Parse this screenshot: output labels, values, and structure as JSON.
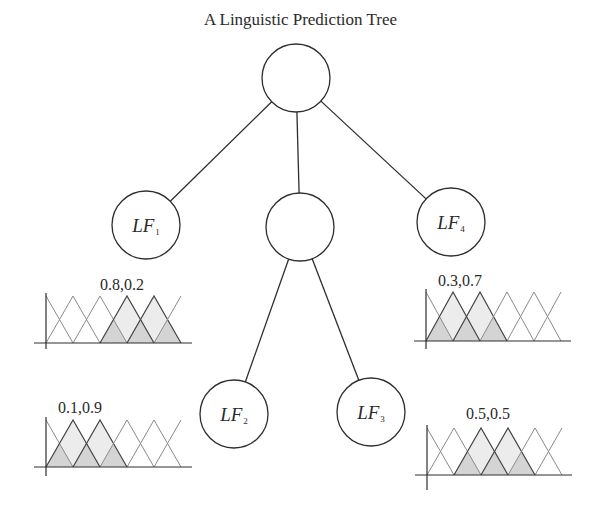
{
  "title": "A Linguistic Prediction Tree",
  "colors": {
    "stroke": "#2e2e2e",
    "mf_stroke": "#555555",
    "fill_light": "#ececec",
    "fill_dark": "#d4d4d4",
    "background": "#ffffff"
  },
  "tree": {
    "nodes": [
      {
        "id": "root",
        "cx": 296,
        "cy": 78,
        "r": 34,
        "label": "",
        "sub": ""
      },
      {
        "id": "lf1",
        "cx": 146,
        "cy": 225,
        "r": 34,
        "label": "LF",
        "sub": "1"
      },
      {
        "id": "mid",
        "cx": 300,
        "cy": 227,
        "r": 34,
        "label": "",
        "sub": ""
      },
      {
        "id": "lf4",
        "cx": 451,
        "cy": 222,
        "r": 34,
        "label": "LF",
        "sub": "4"
      },
      {
        "id": "lf2",
        "cx": 234,
        "cy": 414,
        "r": 34,
        "label": "LF",
        "sub": "2"
      },
      {
        "id": "lf3",
        "cx": 371,
        "cy": 412,
        "r": 34,
        "label": "LF",
        "sub": "3"
      }
    ],
    "edges": [
      {
        "from": "root",
        "to": "lf1"
      },
      {
        "from": "root",
        "to": "mid"
      },
      {
        "from": "root",
        "to": "lf4"
      },
      {
        "from": "mid",
        "to": "lf2"
      },
      {
        "from": "mid",
        "to": "lf3"
      }
    ]
  },
  "membership_charts": [
    {
      "id": "mf-lf1",
      "label": "0.8,0.2",
      "label_x": 100,
      "label_y": 276,
      "axis_x": 46,
      "top": 296,
      "base": 343,
      "axis_bottom": 349,
      "axis_right": 192,
      "step": 27,
      "shaded_peaks": [
        3,
        4
      ]
    },
    {
      "id": "mf-lf4",
      "label": "0.3,0.7",
      "label_x": 438,
      "label_y": 272,
      "axis_x": 426,
      "top": 292,
      "base": 341,
      "axis_bottom": 349,
      "axis_right": 571,
      "step": 27,
      "shaded_peaks": [
        1,
        2
      ]
    },
    {
      "id": "mf-lf2",
      "label": "0.1,0.9",
      "label_x": 58,
      "label_y": 399,
      "axis_x": 46,
      "top": 420,
      "base": 467,
      "axis_bottom": 476,
      "axis_right": 192,
      "step": 27,
      "shaded_peaks": [
        1,
        2
      ]
    },
    {
      "id": "mf-lf3",
      "label": "0.5,0.5",
      "label_x": 466,
      "label_y": 405,
      "axis_x": 427,
      "top": 428,
      "base": 475,
      "axis_bottom": 490,
      "axis_right": 572,
      "step": 27,
      "shaded_peaks": [
        2,
        3
      ]
    }
  ]
}
